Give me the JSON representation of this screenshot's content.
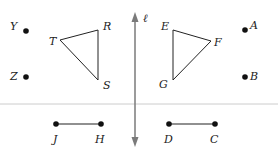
{
  "diagram": {
    "axis_label": "ℓ",
    "colors": {
      "axis": "#7a7a7a",
      "divider": "#cccccc",
      "shape": "#222222",
      "point": "#111111"
    },
    "points": {
      "Y": "Y",
      "Z": "Z",
      "A": "A",
      "B": "B"
    },
    "triangle_left": {
      "vertices": [
        "T",
        "R",
        "S"
      ],
      "T": "T",
      "R": "R",
      "S": "S"
    },
    "triangle_right": {
      "vertices": [
        "E",
        "F",
        "G"
      ],
      "E": "E",
      "F": "F",
      "G": "G"
    },
    "segment_left": {
      "endpoints": [
        "J",
        "H"
      ],
      "J": "J",
      "H": "H"
    },
    "segment_right": {
      "endpoints": [
        "D",
        "C"
      ],
      "D": "D",
      "C": "C"
    }
  }
}
